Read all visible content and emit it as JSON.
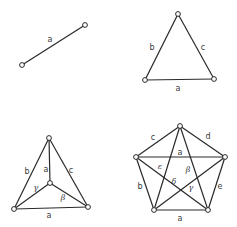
{
  "colors": {
    "stroke": "#2a2a2a",
    "label": "#3a3a3a",
    "background": "#ffffff"
  },
  "graphs": [
    {
      "name": "single-edge-graph",
      "nodes": [
        {
          "id": "n1",
          "x": 22,
          "y": 65
        },
        {
          "id": "n2",
          "x": 85,
          "y": 25
        }
      ],
      "edges": [
        [
          "n1",
          "n2"
        ]
      ],
      "labels": [
        {
          "text": "a",
          "x": 50,
          "y": 40,
          "greek": false
        }
      ]
    },
    {
      "name": "triangle-graph",
      "nodes": [
        {
          "id": "t",
          "x": 178,
          "y": 14
        },
        {
          "id": "l",
          "x": 145,
          "y": 80
        },
        {
          "id": "r",
          "x": 214,
          "y": 79
        }
      ],
      "edges": [
        [
          "t",
          "l"
        ],
        [
          "t",
          "r"
        ],
        [
          "l",
          "r"
        ]
      ],
      "labels": [
        {
          "text": "b",
          "x": 152,
          "y": 48,
          "greek": false
        },
        {
          "text": "c",
          "x": 203,
          "y": 48,
          "greek": false
        },
        {
          "text": "a",
          "x": 178,
          "y": 89,
          "greek": false
        }
      ]
    },
    {
      "name": "triangle-with-center-graph",
      "nodes": [
        {
          "id": "t",
          "x": 49,
          "y": 138
        },
        {
          "id": "l",
          "x": 14,
          "y": 209
        },
        {
          "id": "r",
          "x": 88,
          "y": 207
        },
        {
          "id": "c",
          "x": 50,
          "y": 183
        }
      ],
      "edges": [
        [
          "t",
          "l"
        ],
        [
          "t",
          "r"
        ],
        [
          "l",
          "r"
        ],
        [
          "t",
          "c"
        ],
        [
          "l",
          "c"
        ],
        [
          "r",
          "c"
        ]
      ],
      "labels": [
        {
          "text": "b",
          "x": 27,
          "y": 172,
          "greek": false
        },
        {
          "text": "a",
          "x": 46,
          "y": 170,
          "greek": false
        },
        {
          "text": "c",
          "x": 71,
          "y": 171,
          "greek": false
        },
        {
          "text": "γ",
          "x": 36,
          "y": 188,
          "greek": true
        },
        {
          "text": "β",
          "x": 63,
          "y": 198,
          "greek": true
        },
        {
          "text": "a",
          "x": 49,
          "y": 216,
          "greek": false
        }
      ]
    },
    {
      "name": "complete-pentagon-graph",
      "nodes": [
        {
          "id": "t",
          "x": 180,
          "y": 126
        },
        {
          "id": "l",
          "x": 136,
          "y": 157
        },
        {
          "id": "r",
          "x": 225,
          "y": 157
        },
        {
          "id": "bl",
          "x": 154,
          "y": 210
        },
        {
          "id": "br",
          "x": 208,
          "y": 210
        }
      ],
      "edges": [
        [
          "t",
          "l"
        ],
        [
          "t",
          "r"
        ],
        [
          "l",
          "bl"
        ],
        [
          "r",
          "br"
        ],
        [
          "bl",
          "br"
        ],
        [
          "l",
          "r"
        ],
        [
          "t",
          "bl"
        ],
        [
          "t",
          "br"
        ],
        [
          "l",
          "br"
        ],
        [
          "r",
          "bl"
        ]
      ],
      "labels": [
        {
          "text": "c",
          "x": 153,
          "y": 138,
          "greek": false
        },
        {
          "text": "d",
          "x": 208,
          "y": 137,
          "greek": false
        },
        {
          "text": "a",
          "x": 180,
          "y": 153,
          "greek": false
        },
        {
          "text": "ε",
          "x": 160,
          "y": 167,
          "greek": true
        },
        {
          "text": "β",
          "x": 188,
          "y": 170,
          "greek": true
        },
        {
          "text": "δ",
          "x": 174,
          "y": 182,
          "greek": true
        },
        {
          "text": "γ",
          "x": 191,
          "y": 188,
          "greek": true
        },
        {
          "text": "b",
          "x": 140,
          "y": 187,
          "greek": false
        },
        {
          "text": "e",
          "x": 220,
          "y": 187,
          "greek": false
        },
        {
          "text": "a",
          "x": 180,
          "y": 219,
          "greek": false
        }
      ]
    }
  ]
}
